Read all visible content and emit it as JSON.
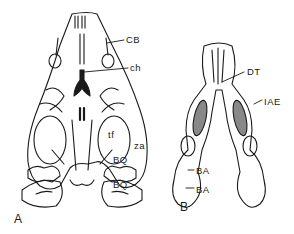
{
  "figure": {
    "panels": [
      {
        "id": "A",
        "label": "A"
      },
      {
        "id": "B",
        "label": "B"
      }
    ],
    "labels": {
      "cb": "CB",
      "ch": "ch",
      "tf": "tf",
      "za": "za",
      "bq_upper": "BQ",
      "bq_lower": "BQ",
      "dt": "DT",
      "iae": "IAE",
      "ba_upper": "BA",
      "ba_lower": "BA"
    },
    "colors": {
      "ink": "#1a1a1a",
      "background": "#ffffff"
    }
  }
}
